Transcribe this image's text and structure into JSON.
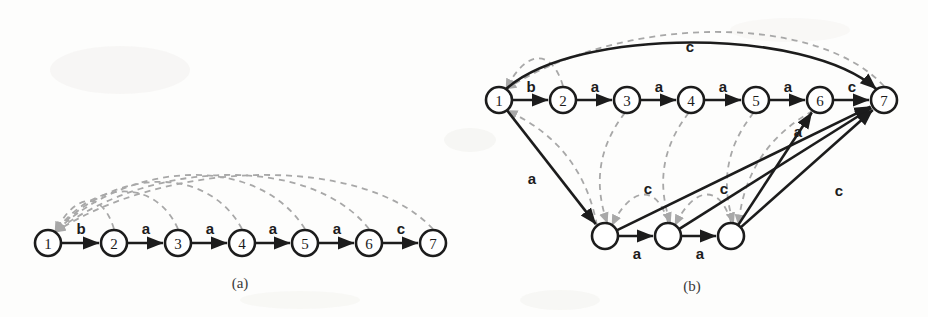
{
  "figure": {
    "width": 928,
    "height": 317,
    "background": "#fdfdfc",
    "colors": {
      "goto_edge": "#1c1c1c",
      "fail_edge": "#a8a8a8",
      "node_stroke": "#1c1c1c",
      "node_fill": "#ffffff",
      "text": "#1c1c1c"
    }
  },
  "panels": [
    {
      "id": "a",
      "caption": "(a)",
      "caption_x": 240,
      "caption_y": 283,
      "node_radius": 13,
      "nodes": [
        {
          "id": "a1",
          "label": "1",
          "x": 48,
          "y": 243
        },
        {
          "id": "a2",
          "label": "2",
          "x": 114,
          "y": 243
        },
        {
          "id": "a3",
          "label": "3",
          "x": 178,
          "y": 243
        },
        {
          "id": "a4",
          "label": "4",
          "x": 242,
          "y": 243
        },
        {
          "id": "a5",
          "label": "5",
          "x": 305,
          "y": 243
        },
        {
          "id": "a6",
          "label": "6",
          "x": 369,
          "y": 243
        },
        {
          "id": "a7",
          "label": "7",
          "x": 433,
          "y": 243
        }
      ],
      "goto_edges": [
        {
          "from": "a1",
          "to": "a2",
          "label": "b",
          "label_x": 81,
          "label_y": 228
        },
        {
          "from": "a2",
          "to": "a3",
          "label": "a",
          "label_x": 146,
          "label_y": 228
        },
        {
          "from": "a3",
          "to": "a4",
          "label": "a",
          "label_x": 210,
          "label_y": 228
        },
        {
          "from": "a4",
          "to": "a5",
          "label": "a",
          "label_x": 273,
          "label_y": 228
        },
        {
          "from": "a5",
          "to": "a6",
          "label": "a",
          "label_x": 337,
          "label_y": 228
        },
        {
          "from": "a6",
          "to": "a7",
          "label": "c",
          "label_x": 401,
          "label_y": 228
        }
      ],
      "fail_edges": [
        {
          "from": "a2",
          "to": "a1"
        },
        {
          "from": "a3",
          "to": "a1"
        },
        {
          "from": "a4",
          "to": "a1"
        },
        {
          "from": "a5",
          "to": "a1"
        },
        {
          "from": "a6",
          "to": "a1"
        },
        {
          "from": "a7",
          "to": "a1"
        }
      ]
    },
    {
      "id": "b",
      "caption": "(b)",
      "caption_x": 692,
      "caption_y": 286,
      "node_radius": 13,
      "nodes": [
        {
          "id": "b1",
          "label": "1",
          "x": 499,
          "y": 100
        },
        {
          "id": "b2",
          "label": "2",
          "x": 563,
          "y": 100
        },
        {
          "id": "b3",
          "label": "3",
          "x": 627,
          "y": 100
        },
        {
          "id": "b4",
          "label": "4",
          "x": 691,
          "y": 100
        },
        {
          "id": "b5",
          "label": "5",
          "x": 756,
          "y": 100
        },
        {
          "id": "b6",
          "label": "6",
          "x": 820,
          "y": 100
        },
        {
          "id": "b7",
          "label": "7",
          "x": 884,
          "y": 100
        },
        {
          "id": "b8",
          "label": "",
          "x": 605,
          "y": 236
        },
        {
          "id": "b9",
          "label": "",
          "x": 668,
          "y": 236
        },
        {
          "id": "b10",
          "label": "",
          "x": 731,
          "y": 236
        }
      ],
      "goto_edges": [
        {
          "from": "b1",
          "to": "b2",
          "label": "b",
          "label_x": 531,
          "label_y": 86
        },
        {
          "from": "b2",
          "to": "b3",
          "label": "a",
          "label_x": 595,
          "label_y": 86
        },
        {
          "from": "b3",
          "to": "b4",
          "label": "a",
          "label_x": 659,
          "label_y": 86
        },
        {
          "from": "b4",
          "to": "b5",
          "label": "a",
          "label_x": 723,
          "label_y": 86
        },
        {
          "from": "b5",
          "to": "b6",
          "label": "a",
          "label_x": 788,
          "label_y": 86
        },
        {
          "from": "b6",
          "to": "b7",
          "label": "c",
          "label_x": 852,
          "label_y": 86
        },
        {
          "from": "b1",
          "to": "b7",
          "label": "c",
          "label_x": 690,
          "label_y": 46,
          "curved": true
        },
        {
          "from": "b1",
          "to": "b8",
          "label": "a",
          "label_x": 532,
          "label_y": 178
        },
        {
          "from": "b8",
          "to": "b9",
          "label": "a",
          "label_x": 637,
          "label_y": 253
        },
        {
          "from": "b9",
          "to": "b10",
          "label": "a",
          "label_x": 700,
          "label_y": 253
        },
        {
          "from": "b8",
          "to": "b7",
          "label": "c",
          "label_x": 648,
          "label_y": 188
        },
        {
          "from": "b9",
          "to": "b7",
          "label": "c",
          "label_x": 724,
          "label_y": 188
        },
        {
          "from": "b10",
          "to": "b6",
          "label": "a",
          "label_x": 798,
          "label_y": 131
        },
        {
          "from": "b10",
          "to": "b7",
          "label": "c",
          "label_x": 839,
          "label_y": 190
        }
      ],
      "fail_edges": [
        {
          "from": "b2",
          "to": "b1"
        },
        {
          "from": "b3",
          "to": "b8"
        },
        {
          "from": "b4",
          "to": "b9"
        },
        {
          "from": "b5",
          "to": "b10"
        },
        {
          "from": "b6",
          "to": "b10"
        },
        {
          "from": "b7",
          "to": "b1"
        },
        {
          "from": "b8",
          "to": "b1"
        },
        {
          "from": "b9",
          "to": "b8"
        },
        {
          "from": "b10",
          "to": "b9"
        }
      ]
    }
  ]
}
